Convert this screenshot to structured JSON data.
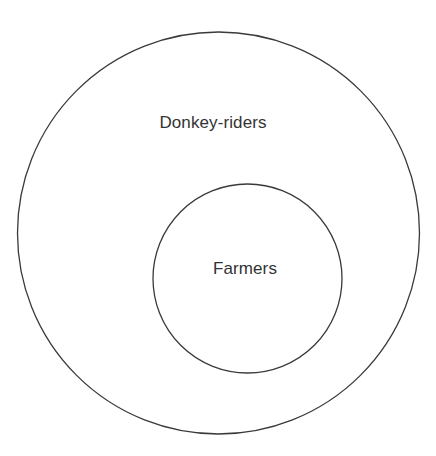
{
  "diagram": {
    "type": "euler-nested-sets",
    "background_color": "#ffffff",
    "stroke_color": "#3a3a3a",
    "text_color": "#333333",
    "sets": [
      {
        "id": "outer",
        "label": "Donkey-riders",
        "shape": "circle",
        "center_x": 218.5,
        "center_y": 233,
        "radius": 201,
        "label_x": 213,
        "label_y": 122,
        "fill": "none",
        "stroke": "#3a3a3a",
        "stroke_width": 1.3
      },
      {
        "id": "inner",
        "label": "Farmers",
        "shape": "circle",
        "center_x": 247.5,
        "center_y": 278.5,
        "radius": 94.5,
        "label_x": 245,
        "label_y": 268,
        "fill": "none",
        "stroke": "#3a3a3a",
        "stroke_width": 1.3
      }
    ]
  }
}
